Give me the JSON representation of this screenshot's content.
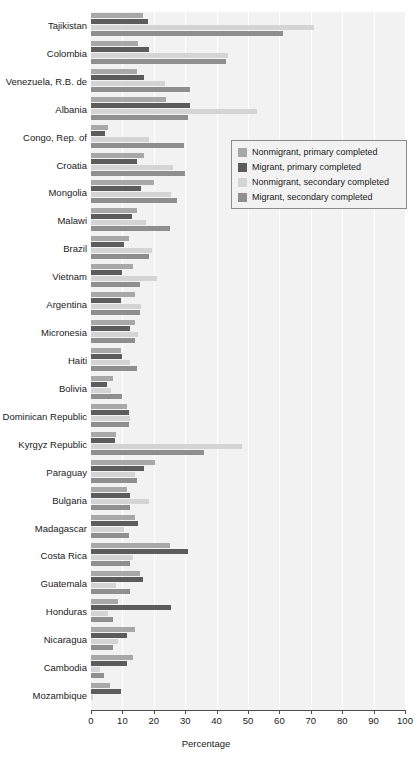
{
  "chart_data": {
    "type": "bar",
    "orientation": "horizontal",
    "title": "",
    "xlabel": "Percentage",
    "ylabel": "",
    "xlim": [
      0,
      100
    ],
    "xticks": [
      0,
      10,
      20,
      30,
      40,
      50,
      60,
      70,
      80,
      90,
      100
    ],
    "grid": true,
    "grid_axis": "x",
    "legend_position": "upper right inside",
    "categories": [
      "Tajikistan",
      "Colombia",
      "Venezuela, R.B. de",
      "Albania",
      "Congo, Rep. of",
      "Croatia",
      "Mongolia",
      "Malawi",
      "Brazil",
      "Vietnam",
      "Argentina",
      "Micronesia",
      "Haiti",
      "Bolivia",
      "Dominican Republic",
      "Kyrgyz Republic",
      "Paraguay",
      "Bulgaria",
      "Madagascar",
      "Costa Rica",
      "Guatemala",
      "Honduras",
      "Nicaragua",
      "Cambodia",
      "Mozambique"
    ],
    "series": [
      {
        "name": "Nonmigrant, primary completed",
        "color": "#a8a8a8",
        "values": [
          16.5,
          15.0,
          14.5,
          24.0,
          5.5,
          17.0,
          20.0,
          14.5,
          12.0,
          13.5,
          14.0,
          14.0,
          9.5,
          7.0,
          11.5,
          8.0,
          20.5,
          11.5,
          14.0,
          25.0,
          15.5,
          8.5,
          14.0,
          13.5,
          6.0
        ]
      },
      {
        "name": "Migrant, primary completed",
        "color": "#5c5c5c",
        "values": [
          18.0,
          18.5,
          17.0,
          31.5,
          4.5,
          14.5,
          16.0,
          13.0,
          10.5,
          10.0,
          9.5,
          12.5,
          10.0,
          5.0,
          12.0,
          7.5,
          17.0,
          12.5,
          15.0,
          31.0,
          16.5,
          25.5,
          11.5,
          11.5,
          9.5
        ]
      },
      {
        "name": "Nonmigrant, secondary completed",
        "color": "#d4d4d4",
        "values": [
          71.0,
          43.5,
          23.5,
          53.0,
          18.5,
          26.0,
          25.5,
          17.5,
          19.5,
          21.0,
          16.0,
          15.0,
          12.5,
          6.5,
          12.5,
          48.0,
          14.0,
          18.5,
          10.5,
          13.5,
          8.0,
          5.5,
          8.5,
          3.0,
          0.7
        ]
      },
      {
        "name": "Migrant, secondary completed",
        "color": "#8f8f8f",
        "values": [
          61.0,
          43.0,
          31.5,
          31.0,
          29.5,
          30.0,
          27.5,
          25.0,
          18.5,
          15.5,
          15.5,
          14.0,
          14.5,
          10.0,
          12.0,
          36.0,
          14.5,
          12.5,
          12.0,
          12.5,
          12.5,
          7.0,
          7.0,
          4.0,
          0.0
        ]
      }
    ]
  },
  "axis": {
    "x_title": "Percentage",
    "tick_labels": [
      "0",
      "10",
      "20",
      "30",
      "40",
      "50",
      "60",
      "70",
      "80",
      "90",
      "100"
    ]
  },
  "legend": {
    "items": [
      {
        "label": "Nonmigrant, primary completed",
        "color": "#a8a8a8"
      },
      {
        "label": "Migrant, primary completed",
        "color": "#5c5c5c"
      },
      {
        "label": "Nonmigrant, secondary completed",
        "color": "#d4d4d4"
      },
      {
        "label": "Migrant, secondary completed",
        "color": "#8f8f8f"
      }
    ]
  },
  "colors": {
    "plot_background": "#f2f2f2",
    "gridline": "#ffffff",
    "axis": "#4d4d4d",
    "text": "#1a1a1a"
  }
}
